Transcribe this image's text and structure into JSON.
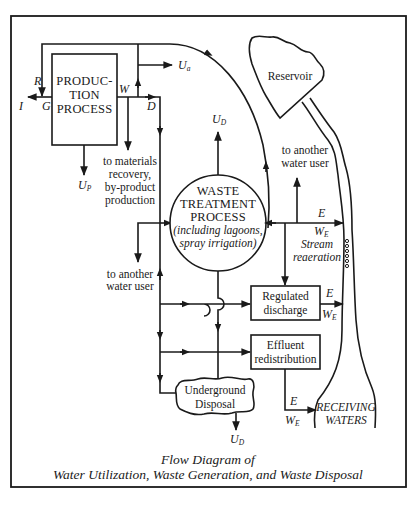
{
  "figure": {
    "caption_line1": "Flow Diagram of",
    "caption_line2": "Water Utilization, Waste Generation, and Waste Disposal"
  },
  "nodes": {
    "production": {
      "line1": "PRODUC-",
      "line2": "TION",
      "line3": "PROCESS"
    },
    "waste_treatment": {
      "line1": "WASTE",
      "line2": "TREATMENT",
      "line3": "PROCESS",
      "line4": "(including lagoons,",
      "line5": "spray irrigation)"
    },
    "reservoir": "Reservoir",
    "regulated_discharge": {
      "line1": "Regulated",
      "line2": "discharge"
    },
    "effluent_redistribution": {
      "line1": "Effluent",
      "line2": "redistribution"
    },
    "underground_disposal": {
      "line1": "Underground",
      "line2": "Disposal"
    },
    "receiving_waters": {
      "line1": "RECEIVING",
      "line2": "WATERS"
    }
  },
  "labels": {
    "materials_recovery": {
      "line1": "to materials",
      "line2": "recovery,",
      "line3": "by-product",
      "line4": "production"
    },
    "another_user_left": {
      "line1": "to another",
      "line2": "water user"
    },
    "another_user_right": {
      "line1": "to another",
      "line2": "water user"
    },
    "stream_reaeration": {
      "line1": "Stream",
      "line2": "reaeration"
    }
  },
  "symbols": {
    "R": "R",
    "I": "I",
    "G": "G",
    "W": "W",
    "D": "D",
    "U": "U",
    "U_a_sub": "a",
    "U_P_sub": "P",
    "U_D_sub": "D",
    "E": "E",
    "W_E_sub": "E"
  }
}
